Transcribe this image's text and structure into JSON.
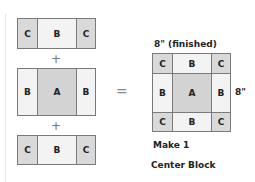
{
  "diagram": {
    "operators": {
      "plus": "+",
      "equals": "="
    },
    "strips": [
      {
        "row": "top",
        "cells": [
          "C",
          "B",
          "C"
        ]
      },
      {
        "row": "middle",
        "cells": [
          "B",
          "A",
          "B"
        ]
      },
      {
        "row": "bottom",
        "cells": [
          "C",
          "B",
          "C"
        ]
      }
    ],
    "result": {
      "width_label": "8\" (finished)",
      "height_label": "8\"",
      "grid": [
        [
          "C",
          "B",
          "C"
        ],
        [
          "B",
          "A",
          "B"
        ],
        [
          "C",
          "B",
          "C"
        ]
      ],
      "quantity_label": "Make 1",
      "name": "Center Block"
    },
    "colors": {
      "C": "#d9d9d9",
      "B": "#f3f3f3",
      "A": "#d3d3d3",
      "border": "#7a7a7a"
    }
  }
}
